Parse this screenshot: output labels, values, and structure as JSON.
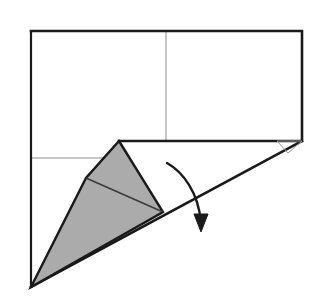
{
  "figure": {
    "canvas": {
      "width": 321,
      "height": 306
    },
    "colors": {
      "background": "#ffffff",
      "outline": "#1a1a1a",
      "crease_thin": "#8c8c8c",
      "shaded_fill": "#ababab",
      "shaded_stroke": "#1a1a1a",
      "arrow": "#1a1a1a",
      "flap_stroke": "#9a9a9a"
    },
    "stroke_widths": {
      "outline": 2.6,
      "crease_thin": 1.0,
      "shape_outline": 2.4,
      "inner_crease": 1.4,
      "arrow": 2.4,
      "flap": 1.0
    },
    "parts": {
      "sheet_outline_label": "paper-sheet-outline",
      "sheet_points": "31,31 302,31 302,141 119,141",
      "vertical_crease_label": "vertical-crease-line",
      "vertical_crease": {
        "x1": 166,
        "y1": 31,
        "x2": 166,
        "y2": 141
      },
      "horizontal_crease_label": "horizontal-crease-line",
      "horizontal_crease": {
        "x1": 31,
        "y1": 158,
        "x2": 112,
        "y2": 158
      },
      "left_edge_label": "left-edge-line",
      "left_edge": {
        "x1": 31,
        "y1": 31,
        "x2": 31,
        "y2": 287
      },
      "fold_diagonal_label": "fold-diagonal-edge",
      "fold_diagonal": {
        "x1": 31,
        "y1": 287,
        "x2": 302,
        "y2": 141
      },
      "shaded_flap_label": "shaded-folded-flap",
      "shaded_flap_points": "119,141 163,212 31,287 86,178",
      "inner_crease_label": "flap-inner-crease",
      "inner_crease": {
        "x1": 86,
        "y1": 178,
        "x2": 163,
        "y2": 212
      },
      "small_flap_label": "small-corner-flap",
      "small_flap_points": "277,141 302,141 288,153",
      "arrow_label": "fold-direction-arrow",
      "arrow_path": "M 167 163 C 183 172, 198 192, 201 222",
      "arrow_head_points": "201,232 194,214 208,214"
    }
  }
}
